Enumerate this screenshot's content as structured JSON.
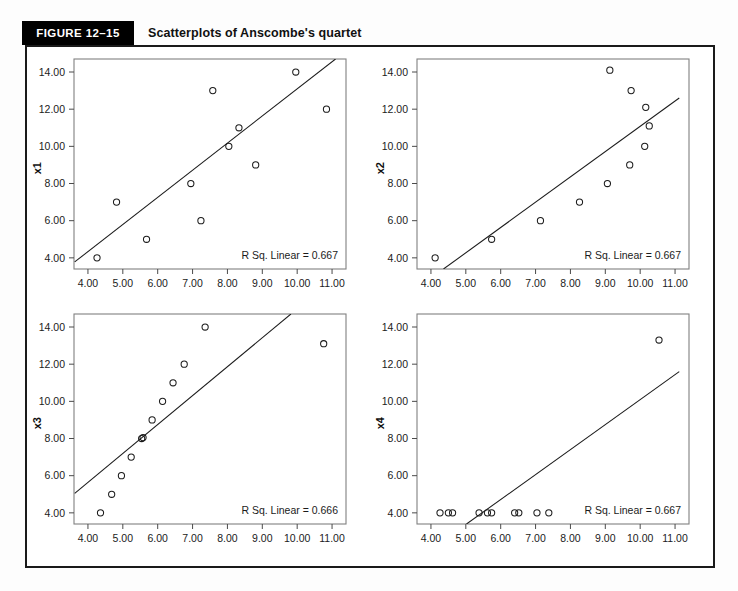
{
  "header": {
    "figure_tag": "FIGURE 12–15",
    "title": "Scatterplots of Anscombe's quartet"
  },
  "chart_data": [
    {
      "type": "scatter",
      "panel": 1,
      "ylabel": "x1",
      "xlabel": "",
      "annotation": "R Sq. Linear = 0.667",
      "xlim": [
        3.6,
        11.4
      ],
      "ylim": [
        3.4,
        14.7
      ],
      "xticks": [
        4.0,
        5.0,
        6.0,
        7.0,
        8.0,
        9.0,
        10.0,
        11.0
      ],
      "xticklabels": [
        "4.00",
        "5.00",
        "6.00",
        "7.00",
        "8.00",
        "9.00",
        "10.00",
        "11.00"
      ],
      "yticks": [
        4.0,
        6.0,
        8.0,
        10.0,
        12.0,
        14.0
      ],
      "yticklabels": [
        "4.00",
        "6.00",
        "8.00",
        "10.00",
        "12.00",
        "14.00"
      ],
      "grid": false,
      "x": [
        4.26,
        4.82,
        5.68,
        6.95,
        7.24,
        7.58,
        8.04,
        8.33,
        8.81,
        9.96,
        10.84
      ],
      "y": [
        4.0,
        7.0,
        5.0,
        8.0,
        6.0,
        13.0,
        10.0,
        11.0,
        9.0,
        14.0,
        12.0
      ],
      "fit_line": {
        "x0": 3.62,
        "y0": 3.78,
        "x1": 11.1,
        "y1": 14.7
      }
    },
    {
      "type": "scatter",
      "panel": 2,
      "ylabel": "x2",
      "xlabel": "",
      "annotation": "R Sq. Linear = 0.667",
      "xlim": [
        3.6,
        11.4
      ],
      "ylim": [
        3.4,
        14.7
      ],
      "xticks": [
        4.0,
        5.0,
        6.0,
        7.0,
        8.0,
        9.0,
        10.0,
        11.0
      ],
      "xticklabels": [
        "4.00",
        "5.00",
        "6.00",
        "7.00",
        "8.00",
        "9.00",
        "10.00",
        "11.00"
      ],
      "yticks": [
        4.0,
        6.0,
        8.0,
        10.0,
        12.0,
        14.0
      ],
      "yticklabels": [
        "4.00",
        "6.00",
        "8.00",
        "10.00",
        "12.00",
        "14.00"
      ],
      "grid": false,
      "x": [
        4.12,
        5.74,
        7.14,
        8.26,
        9.06,
        9.13,
        9.7,
        9.74,
        10.13,
        10.16,
        10.26
      ],
      "y": [
        4.0,
        5.0,
        6.0,
        7.0,
        8.0,
        14.1,
        9.0,
        13.0,
        10.0,
        12.1,
        11.1
      ],
      "fit_line": {
        "x0": 4.36,
        "y0": 3.4,
        "x1": 11.12,
        "y1": 12.6
      }
    },
    {
      "type": "scatter",
      "panel": 3,
      "ylabel": "x3",
      "xlabel": "",
      "annotation": "R Sq. Linear = 0.666",
      "xlim": [
        3.6,
        11.4
      ],
      "ylim": [
        3.4,
        14.7
      ],
      "xticks": [
        4.0,
        5.0,
        6.0,
        7.0,
        8.0,
        9.0,
        10.0,
        11.0
      ],
      "xticklabels": [
        "4.00",
        "5.00",
        "6.00",
        "7.00",
        "8.00",
        "9.00",
        "10.00",
        "11.00"
      ],
      "yticks": [
        4.0,
        6.0,
        8.0,
        10.0,
        12.0,
        14.0
      ],
      "yticklabels": [
        "4.00",
        "6.00",
        "8.00",
        "10.00",
        "12.00",
        "14.00"
      ],
      "grid": false,
      "x": [
        4.36,
        4.68,
        4.96,
        5.24,
        5.54,
        5.58,
        5.84,
        6.14,
        6.44,
        6.76,
        7.36,
        10.76
      ],
      "y": [
        4.0,
        5.0,
        6.0,
        7.0,
        8.0,
        8.05,
        9.0,
        10.0,
        11.0,
        12.0,
        14.0,
        13.1
      ],
      "fit_line": {
        "x0": 3.62,
        "y0": 5.05,
        "x1": 9.82,
        "y1": 14.7
      }
    },
    {
      "type": "scatter",
      "panel": 4,
      "ylabel": "x4",
      "xlabel": "",
      "annotation": "R Sq. Linear = 0.667",
      "xlim": [
        3.6,
        11.4
      ],
      "ylim": [
        3.4,
        14.7
      ],
      "xticks": [
        4.0,
        5.0,
        6.0,
        7.0,
        8.0,
        9.0,
        10.0,
        11.0
      ],
      "xticklabels": [
        "4.00",
        "5.00",
        "6.00",
        "7.00",
        "8.00",
        "9.00",
        "10.00",
        "11.00"
      ],
      "yticks": [
        4.0,
        6.0,
        8.0,
        10.0,
        12.0,
        14.0
      ],
      "yticklabels": [
        "4.00",
        "6.00",
        "8.00",
        "10.00",
        "12.00",
        "14.00"
      ],
      "grid": false,
      "x": [
        4.26,
        4.5,
        4.62,
        5.38,
        5.62,
        5.74,
        6.4,
        6.52,
        7.04,
        7.38,
        10.54
      ],
      "y": [
        4.0,
        4.0,
        4.0,
        4.0,
        4.0,
        4.0,
        4.0,
        4.0,
        4.0,
        4.0,
        13.3
      ],
      "fit_line": {
        "x0": 5.02,
        "y0": 3.4,
        "x1": 11.12,
        "y1": 11.6
      }
    }
  ],
  "colors": {
    "tag_background": "#000000",
    "tag_text": "#ffffff",
    "frame": "#1a1a1a",
    "marker_stroke": "#1b1b1b",
    "fit_line": "#1b1b1b",
    "plot_box": "#808080",
    "page_background": "#fdfdfd"
  }
}
